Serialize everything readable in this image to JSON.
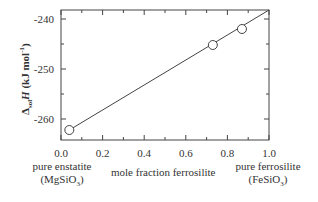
{
  "chart_data": {
    "type": "scatter",
    "title": "",
    "xlabel": "mole fraction ferrosilite",
    "ylabel": "Δsol H (kJ mol⁻¹)",
    "ylabel_parts": {
      "delta": "Δ",
      "sub": "sol",
      "var": "H",
      "unit": " (kJ mol",
      "unit_sup": "-1",
      "unit_end": ")"
    },
    "xlim": [
      0.0,
      1.0
    ],
    "ylim": [
      -264.2,
      -238.2
    ],
    "x_ticks": [
      0.0,
      0.2,
      0.4,
      0.6,
      0.8,
      1.0
    ],
    "x_tick_labels": [
      "0.0",
      "0.2",
      "0.4",
      "0.6",
      "0.8",
      "1.0"
    ],
    "x_minor_ticks": [
      0.1,
      0.3,
      0.5,
      0.7,
      0.9
    ],
    "y_ticks": [
      -240,
      -250,
      -260
    ],
    "y_tick_labels": [
      "-240",
      "-250",
      "-260"
    ],
    "y_minor_ticks": [
      -245,
      -255
    ],
    "grid": false,
    "series": [
      {
        "name": "measured",
        "marker": "open-circle",
        "x": [
          0.04,
          0.73,
          0.87
        ],
        "y": [
          -262.2,
          -245.2,
          -242.0
        ]
      },
      {
        "name": "linear fit",
        "style": "line",
        "x": [
          0.04,
          1.0
        ],
        "y": [
          -262.2,
          -238.2
        ]
      }
    ],
    "annotations": {
      "left_end": {
        "line1": "pure enstatite",
        "line2_pre": "(MgSiO",
        "line2_sub": "3",
        "line2_post": ")"
      },
      "right_end": {
        "line1": "pure ferrosilite",
        "line2_pre": "(FeSiO",
        "line2_sub": "3",
        "line2_post": ")"
      }
    }
  }
}
